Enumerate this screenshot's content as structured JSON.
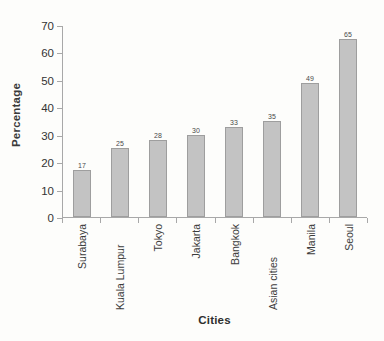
{
  "chart_data": {
    "type": "bar",
    "title": "",
    "xlabel": "Cities",
    "ylabel": "Percentage",
    "categories": [
      "Surabaya",
      "Kuala Lumpur",
      "Tokyo",
      "Jakarta",
      "Bangkok",
      "Asian cities",
      "Manila",
      "Seoul"
    ],
    "values": [
      17,
      25,
      28,
      30,
      33,
      35,
      49,
      65
    ],
    "value_labels": [
      "17",
      "25",
      "28",
      "30",
      "33",
      "35",
      "49",
      "65"
    ],
    "ylim": [
      0,
      70
    ],
    "ytick_step": 10,
    "yticks": [
      0,
      10,
      20,
      30,
      40,
      50,
      60,
      70
    ],
    "ytick_labels": [
      "0",
      "10",
      "20",
      "30",
      "40",
      "50",
      "60",
      "70"
    ],
    "grid": false,
    "legend": false,
    "bar_color": "#c3c3c3",
    "bar_border_color": "#9e9e9e",
    "axis_color": "#a8a8a8",
    "background_color": "#fdfdfb"
  }
}
